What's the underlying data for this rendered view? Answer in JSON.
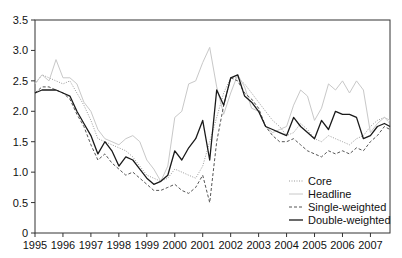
{
  "chart_data": {
    "type": "line",
    "title": "",
    "xlabel": "",
    "ylabel": "",
    "xlim": [
      1995.0,
      2007.7
    ],
    "ylim": [
      0,
      3.5
    ],
    "grid": false,
    "legend_position": "lower right (inside)",
    "x_ticks": [
      "1995",
      "1996",
      "1997",
      "1998",
      "1999",
      "2000",
      "2001",
      "2002",
      "2003",
      "2004",
      "2005",
      "2006",
      "2007"
    ],
    "y_ticks": [
      "0",
      "0.5",
      "1.0",
      "1.5",
      "2.0",
      "2.5",
      "3.0",
      "3.5"
    ],
    "x": [
      1995.0,
      1995.25,
      1995.5,
      1995.75,
      1996.0,
      1996.25,
      1996.5,
      1996.75,
      1997.0,
      1997.25,
      1997.5,
      1997.75,
      1998.0,
      1998.25,
      1998.5,
      1998.75,
      1999.0,
      1999.25,
      1999.5,
      1999.75,
      2000.0,
      2000.25,
      2000.5,
      2000.75,
      2001.0,
      2001.25,
      2001.5,
      2001.75,
      2002.0,
      2002.25,
      2002.5,
      2002.75,
      2003.0,
      2003.25,
      2003.5,
      2003.75,
      2004.0,
      2004.25,
      2004.5,
      2004.75,
      2005.0,
      2005.25,
      2005.5,
      2005.75,
      2006.0,
      2006.25,
      2006.5,
      2006.75,
      2007.0,
      2007.25,
      2007.5,
      2007.7
    ],
    "series": [
      {
        "name": "Core",
        "style": "dotted",
        "color": "#9a9a9a",
        "values": [
          2.45,
          2.6,
          2.55,
          2.5,
          2.45,
          2.5,
          2.3,
          2.1,
          1.85,
          1.55,
          1.5,
          1.45,
          1.4,
          1.35,
          1.25,
          1.1,
          0.95,
          0.9,
          0.85,
          0.9,
          1.05,
          1.0,
          0.95,
          0.9,
          1.1,
          1.5,
          1.9,
          2.3,
          2.55,
          2.55,
          2.45,
          2.3,
          2.15,
          2.0,
          1.85,
          1.75,
          1.6,
          1.65,
          1.8,
          1.7,
          1.55,
          1.5,
          1.6,
          1.55,
          1.5,
          1.45,
          1.55,
          1.6,
          1.75,
          1.85,
          1.9,
          1.8
        ]
      },
      {
        "name": "Headline",
        "style": "solid-thin",
        "color": "#c8c8c8",
        "values": [
          2.45,
          2.6,
          2.5,
          2.85,
          2.55,
          2.55,
          2.45,
          2.15,
          2.0,
          1.7,
          1.55,
          1.5,
          1.45,
          1.55,
          1.6,
          1.5,
          1.2,
          1.05,
          0.85,
          1.1,
          1.9,
          2.0,
          2.45,
          2.5,
          2.8,
          3.05,
          2.4,
          1.95,
          2.3,
          2.6,
          2.4,
          2.05,
          2.0,
          1.75,
          1.65,
          1.7,
          1.75,
          2.1,
          2.35,
          2.25,
          1.85,
          2.05,
          2.45,
          2.35,
          2.5,
          2.3,
          2.5,
          2.35,
          1.65,
          1.8,
          1.9,
          1.85
        ]
      },
      {
        "name": "Single-weighted",
        "style": "dashed",
        "color": "#555555",
        "values": [
          2.3,
          2.4,
          2.4,
          2.35,
          2.3,
          2.2,
          1.95,
          1.75,
          1.45,
          1.2,
          1.3,
          1.15,
          1.05,
          0.95,
          1.0,
          0.9,
          0.8,
          0.7,
          0.7,
          0.75,
          0.8,
          0.7,
          0.65,
          0.75,
          0.95,
          0.5,
          1.5,
          2.1,
          2.55,
          2.5,
          2.3,
          2.2,
          2.05,
          1.75,
          1.6,
          1.5,
          1.5,
          1.55,
          1.45,
          1.35,
          1.3,
          1.25,
          1.35,
          1.3,
          1.35,
          1.3,
          1.4,
          1.35,
          1.5,
          1.6,
          1.75,
          1.7
        ]
      },
      {
        "name": "Double-weighted",
        "style": "solid",
        "color": "#1a1a1a",
        "values": [
          2.3,
          2.35,
          2.35,
          2.35,
          2.3,
          2.25,
          2.0,
          1.8,
          1.6,
          1.3,
          1.5,
          1.35,
          1.1,
          1.25,
          1.2,
          1.05,
          0.9,
          0.8,
          0.85,
          0.95,
          1.35,
          1.2,
          1.4,
          1.55,
          1.85,
          1.2,
          2.35,
          2.1,
          2.55,
          2.6,
          2.25,
          2.15,
          2.0,
          1.75,
          1.7,
          1.65,
          1.6,
          1.9,
          1.75,
          1.65,
          1.55,
          1.85,
          1.7,
          2.0,
          1.95,
          1.95,
          1.9,
          1.55,
          1.6,
          1.75,
          1.8,
          1.75
        ]
      }
    ]
  },
  "legend": {
    "items": [
      {
        "label": "Core"
      },
      {
        "label": "Headline"
      },
      {
        "label": "Single-weighted"
      },
      {
        "label": "Double-weighted"
      }
    ]
  }
}
